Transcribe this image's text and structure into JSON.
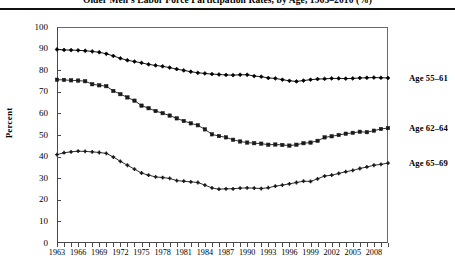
{
  "title": "Older Men's Labor Force Participation Rates, by Age, 1963–2010 (%)",
  "axes": {
    "ylabel": "Percent",
    "yticks": [
      "0",
      "10",
      "20",
      "30",
      "40",
      "50",
      "60",
      "70",
      "80",
      "90",
      "100"
    ],
    "xticks_labeled": [
      "1963",
      "1966",
      "1969",
      "1972",
      "1975",
      "1978",
      "1981",
      "1984",
      "1987",
      "1990",
      "1993",
      "1996",
      "1999",
      "2002",
      "2005",
      "2008"
    ]
  },
  "series_labels": {
    "s1": "Age 55–61",
    "s2": "Age 62–64",
    "s3": "Age 65–69"
  },
  "chart_data": {
    "type": "line",
    "title": "Older Men's Labor Force Participation Rates, by Age, 1963–2010 (%)",
    "xlabel": "",
    "ylabel": "Percent",
    "ylim": [
      0,
      100
    ],
    "xlim": [
      1963,
      2010
    ],
    "ytick_step": 10,
    "grid": false,
    "legend": "right-inline",
    "x": [
      1963,
      1964,
      1965,
      1966,
      1967,
      1968,
      1969,
      1970,
      1971,
      1972,
      1973,
      1974,
      1975,
      1976,
      1977,
      1978,
      1979,
      1980,
      1981,
      1982,
      1983,
      1984,
      1985,
      1986,
      1987,
      1988,
      1989,
      1990,
      1991,
      1992,
      1993,
      1994,
      1995,
      1996,
      1997,
      1998,
      1999,
      2000,
      2001,
      2002,
      2003,
      2004,
      2005,
      2006,
      2007,
      2008,
      2009,
      2010
    ],
    "series": [
      {
        "name": "Age 55–61",
        "marker": "diamond",
        "color": "#000000",
        "values": [
          89.6,
          89.4,
          89.3,
          89.2,
          89.0,
          88.7,
          88.3,
          87.6,
          86.6,
          85.5,
          84.6,
          84.0,
          83.4,
          82.7,
          82.2,
          81.8,
          81.2,
          80.5,
          79.9,
          79.3,
          78.8,
          78.5,
          78.2,
          78.0,
          77.8,
          77.7,
          77.9,
          77.9,
          77.3,
          77.0,
          76.4,
          76.2,
          75.6,
          75.1,
          74.8,
          75.2,
          75.6,
          75.9,
          76.0,
          76.2,
          76.2,
          76.1,
          76.2,
          76.4,
          76.5,
          76.6,
          76.5,
          76.4
        ]
      },
      {
        "name": "Age 62–64",
        "marker": "square",
        "color": "#1a1a1a",
        "values": [
          75.6,
          75.5,
          75.3,
          75.2,
          74.9,
          73.5,
          73.0,
          72.6,
          70.4,
          68.9,
          67.4,
          65.9,
          63.6,
          62.4,
          61.1,
          60.1,
          59.0,
          57.7,
          56.5,
          55.4,
          54.5,
          52.6,
          50.3,
          49.5,
          48.9,
          47.8,
          47.0,
          46.5,
          46.2,
          46.0,
          45.5,
          45.6,
          45.4,
          45.1,
          45.5,
          46.2,
          46.5,
          47.3,
          48.9,
          49.4,
          50.0,
          50.6,
          51.0,
          51.5,
          51.3,
          52.0,
          52.8,
          53.2
        ]
      },
      {
        "name": "Age 65–69",
        "marker": "cross",
        "color": "#1a1a1a",
        "values": [
          40.9,
          41.8,
          42.2,
          42.5,
          42.4,
          42.2,
          41.9,
          41.5,
          39.8,
          37.8,
          36.0,
          34.2,
          32.4,
          31.4,
          30.6,
          30.3,
          29.9,
          28.9,
          28.6,
          28.3,
          28.0,
          26.8,
          25.5,
          24.9,
          25.1,
          25.1,
          25.4,
          25.5,
          25.4,
          25.2,
          25.6,
          26.3,
          26.8,
          27.4,
          28.0,
          28.6,
          28.5,
          29.7,
          31.0,
          31.4,
          32.2,
          33.0,
          33.6,
          34.5,
          35.2,
          36.0,
          36.4,
          37.0
        ]
      }
    ]
  }
}
